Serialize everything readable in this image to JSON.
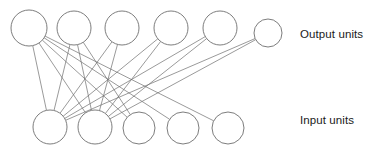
{
  "diagram": {
    "type": "neural-network-layer-diagram",
    "title": "",
    "background_color": "#ffffff",
    "stroke_color": "#6e6e6e",
    "text_color": "#1a1a1a",
    "labels": {
      "output_units": "Output units",
      "input_units": "Input units"
    },
    "layers": [
      {
        "id": "output",
        "name": "Output units",
        "count": 6,
        "nodes": [
          {
            "id": "o1",
            "cx": 29,
            "cy": 28,
            "r": 18
          },
          {
            "id": "o2",
            "cx": 74,
            "cy": 28,
            "r": 17
          },
          {
            "id": "o3",
            "cx": 122,
            "cy": 28,
            "r": 17
          },
          {
            "id": "o4",
            "cx": 171,
            "cy": 28,
            "r": 17
          },
          {
            "id": "o5",
            "cx": 220,
            "cy": 28,
            "r": 17
          },
          {
            "id": "o6",
            "cx": 268,
            "cy": 33,
            "r": 14
          }
        ]
      },
      {
        "id": "input",
        "name": "Input units",
        "count": 5,
        "nodes": [
          {
            "id": "i1",
            "cx": 50,
            "cy": 127,
            "r": 17
          },
          {
            "id": "i2",
            "cx": 95,
            "cy": 127,
            "r": 17
          },
          {
            "id": "i3",
            "cx": 139,
            "cy": 128,
            "r": 16
          },
          {
            "id": "i4",
            "cx": 183,
            "cy": 128,
            "r": 16
          },
          {
            "id": "i5",
            "cx": 228,
            "cy": 128,
            "r": 16
          }
        ]
      }
    ],
    "connections": [
      {
        "from": "o1",
        "to": "i1"
      },
      {
        "from": "o1",
        "to": "i2"
      },
      {
        "from": "o1",
        "to": "i3"
      },
      {
        "from": "o1",
        "to": "i4"
      },
      {
        "from": "o1",
        "to": "i5"
      },
      {
        "from": "o2",
        "to": "i1"
      },
      {
        "from": "o2",
        "to": "i2"
      },
      {
        "from": "o2",
        "to": "i3"
      },
      {
        "from": "o3",
        "to": "i1"
      },
      {
        "from": "o3",
        "to": "i2"
      },
      {
        "from": "o4",
        "to": "i1"
      },
      {
        "from": "o4",
        "to": "i2"
      },
      {
        "from": "o5",
        "to": "i1"
      },
      {
        "from": "o5",
        "to": "i2"
      },
      {
        "from": "o6",
        "to": "i1"
      },
      {
        "from": "o6",
        "to": "i2"
      }
    ]
  }
}
